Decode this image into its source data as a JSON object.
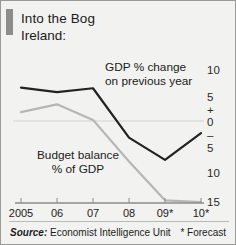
{
  "figure": {
    "title": "Into the Bog",
    "subtitle": "Ireland:",
    "source_label": "Source:",
    "source_text": " Economist Intelligence Unit",
    "forecast_note": "* Forecast"
  },
  "chart_data": {
    "type": "line",
    "title": "Into the Bog",
    "subtitle": "Ireland:",
    "xlabel": "",
    "ylabel": "%",
    "categories": [
      "2005",
      "06",
      "07",
      "08",
      "09*",
      "10*"
    ],
    "x_tick_labels": [
      "2005",
      "06",
      "07",
      "08",
      "09*",
      "10*"
    ],
    "y_tick_labels": [
      "10",
      "5",
      "+",
      "0",
      "–",
      "5",
      "10",
      "15"
    ],
    "y_tick_values": [
      10,
      5,
      null,
      0,
      null,
      -5,
      -10,
      -15
    ],
    "ylim": [
      -16,
      11
    ],
    "y_axis_side": "right",
    "grid": false,
    "zero_line": true,
    "legend": "annotations",
    "annotations": [
      {
        "name": "gdp-annotation",
        "line1": "GDP % change",
        "line2": "on previous year"
      },
      {
        "name": "budget-annotation",
        "line1": "Budget balance",
        "line2": "% of GDP"
      }
    ],
    "series": [
      {
        "name": "GDP % change on previous year",
        "color": "#222222",
        "values": [
          6.0,
          5.2,
          5.9,
          -3.0,
          -7.0,
          -2.2
        ]
      },
      {
        "name": "Budget balance % of GDP",
        "color": "#b6b6b4",
        "values": [
          1.6,
          3.0,
          0.2,
          -7.3,
          -14.3,
          -14.6
        ]
      }
    ]
  },
  "axis_colors": {
    "baseline": "#8d8d8a",
    "zero_line": "#d2d2ce",
    "accent": "#8d8d8a"
  }
}
